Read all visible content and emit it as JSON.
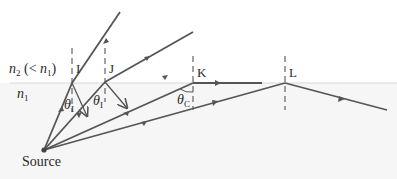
{
  "diagram": {
    "medium_upper_label": "n",
    "medium_upper_sub": "2",
    "medium_upper_note_open": " (< ",
    "medium_upper_note_n": "n",
    "medium_upper_note_sub": "1",
    "medium_upper_note_close": ")",
    "medium_lower_label": "n",
    "medium_lower_sub": "1",
    "points": {
      "I": "I",
      "J": "J",
      "K": "K",
      "L": "L"
    },
    "angles": {
      "theta_I_symbol": "θ",
      "theta_I_sub": "I",
      "theta_J_symbol": "θ",
      "theta_J_sub": "I",
      "theta_c_symbol": "θ",
      "theta_c_sub": "C"
    },
    "source_label": "Source",
    "colors": {
      "ray": "#555555",
      "interface": "#d8d8d8",
      "lower_medium": "#f6f6f6",
      "text": "#2a2a2a"
    }
  }
}
